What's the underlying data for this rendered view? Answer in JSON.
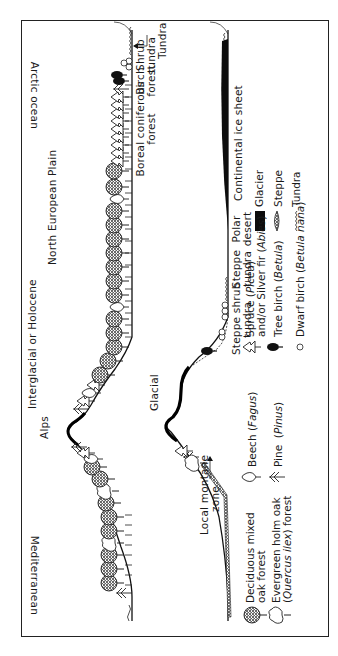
{
  "figure": {
    "orientation": "rotated 90deg counter-clockwise",
    "panels": [
      {
        "id": "interglacial",
        "title": "Interglacial or Holocene",
        "region_labels": {
          "mediterranean": "Mediterranean",
          "alps": "Alps",
          "north_european_plain": "North European Plain",
          "arctic_ocean": "Arctic ocean"
        },
        "zone_labels": {
          "boreal_line1": "Boreal coniferous",
          "boreal_line2": "forest",
          "birch_line1": "Birch",
          "birch_line2": "forest",
          "shrub_line1": "Shrub",
          "shrub_line2": "tundra",
          "tundra": "Tundra"
        }
      },
      {
        "id": "glacial",
        "title": "Glacial",
        "zone_labels": {
          "local_montane_line1": "Local montane",
          "local_montane_line2": "zone",
          "steppe_shrub_line1": "Steppe shrub",
          "steppe_shrub_line2": "tundra",
          "steppe_tundra_line1": "Steppe",
          "steppe_tundra_line2": "tundra",
          "polar_desert_line1": "Polar",
          "polar_desert_line2": "desert",
          "ice_sheet": "Continental ice sheet"
        }
      }
    ],
    "legend": {
      "items": [
        {
          "icon": "deciduous-oak-icon",
          "line1": "Deciduous mixed",
          "line2": "oak forest"
        },
        {
          "icon": "holm-oak-icon",
          "line1": "Evergreen holm oak",
          "line2_pre": "(",
          "line2_italic": "Quercus ilex",
          "line2_post": ") forest"
        },
        {
          "icon": "beech-icon",
          "pre": "Beech (",
          "italic": "Fagus",
          "post": ")"
        },
        {
          "icon": "pine-icon",
          "pre": "Pine  (",
          "italic": "Pinus",
          "post": ")"
        },
        {
          "icon": "spruce-icon",
          "line1_pre": "Spruce (",
          "line1_italic": "Picea",
          "line1_post": ")",
          "line2_pre": "and/or Silver fir (",
          "line2_italic": "Abies",
          "line2_post": ")"
        },
        {
          "icon": "tree-birch-icon",
          "pre": "Tree birch (",
          "italic": "Betula",
          "post": ")"
        },
        {
          "icon": "dwarf-birch-icon",
          "pre": "Dwarf birch (",
          "italic": "Betula nana",
          "post": ")"
        },
        {
          "icon": "glacier-icon",
          "label": "Glacier"
        },
        {
          "icon": "steppe-icon",
          "label": "Steppe"
        },
        {
          "icon": "tundra-icon",
          "label": "Tundra"
        }
      ]
    },
    "colors": {
      "ink": "#1a1a1a",
      "background": "#ffffff",
      "ice": "#0d0d0d"
    }
  }
}
